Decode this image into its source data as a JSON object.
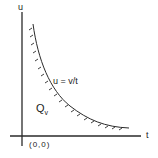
{
  "diagram": {
    "axis_x_label": "t",
    "axis_y_label": "u",
    "origin_label": "(0,0)",
    "curve_label": "u = v/t",
    "region_label": "Q",
    "region_subscript": "v",
    "stroke_color": "#2a2a2a"
  }
}
